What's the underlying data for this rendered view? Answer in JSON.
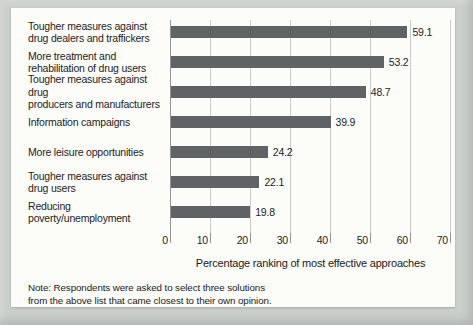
{
  "figure": {
    "note_line1": "Note: Respondents were asked to select three solutions",
    "note_line2": "from the above list that came closest to their own opinion."
  },
  "chart_data": {
    "type": "bar",
    "orientation": "horizontal",
    "title": "",
    "xlabel": "Percentage ranking of most effective approaches",
    "ylabel": "",
    "categories": [
      "Tougher measures against\ndrug dealers and traffickers",
      "More treatment and\nrehabilitation of drug users",
      "Tougher measures against drug\nproducers and manufacturers",
      "Information campaigns",
      "More leisure opportunities",
      "Tougher measures against\ndrug users",
      "Reducing poverty/unemployment"
    ],
    "values": [
      59.1,
      53.2,
      48.7,
      39.9,
      24.2,
      22.1,
      19.8
    ],
    "value_labels": [
      "59.1",
      "53.2",
      "48.7",
      "39.9",
      "24.2",
      "22.1",
      "19.8"
    ],
    "xticks": [
      0,
      10,
      20,
      30,
      40,
      50,
      60,
      70
    ],
    "xlim": [
      0,
      70
    ],
    "grid": true,
    "legend": false,
    "colors": {
      "bar": "#606366",
      "gridline": "#cccccc",
      "axis": "#949494",
      "outer_background": "#cbcfcb",
      "panel_background": "#fcfcf9",
      "text": "#1c1c1c"
    }
  }
}
